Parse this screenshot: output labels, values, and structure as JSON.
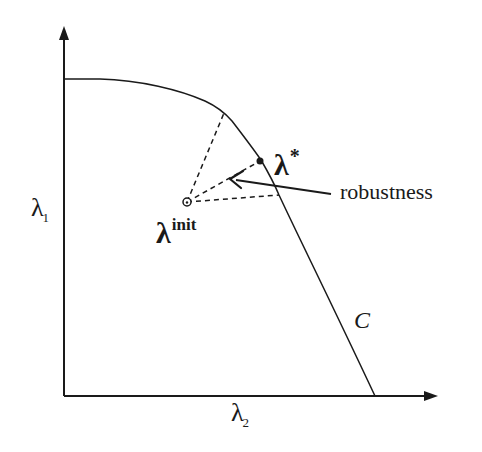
{
  "figure": {
    "axes": {
      "y_axis_label": {
        "symbol": "λ",
        "subscript": "1"
      },
      "x_axis_label": {
        "symbol": "λ",
        "subscript": "2"
      }
    },
    "points": {
      "initial": {
        "symbol": "λ",
        "superscript": "init",
        "marker": "open-circle"
      },
      "optimal": {
        "symbol": "λ",
        "superscript": "*",
        "marker": "filled-dot"
      }
    },
    "annotation": {
      "text": "robustness",
      "arrow": "left-pointing arrow toward dashed cone"
    },
    "curve": {
      "label": "C"
    },
    "colors": {
      "stroke": "#1a1a1a",
      "background": "#ffffff"
    }
  }
}
